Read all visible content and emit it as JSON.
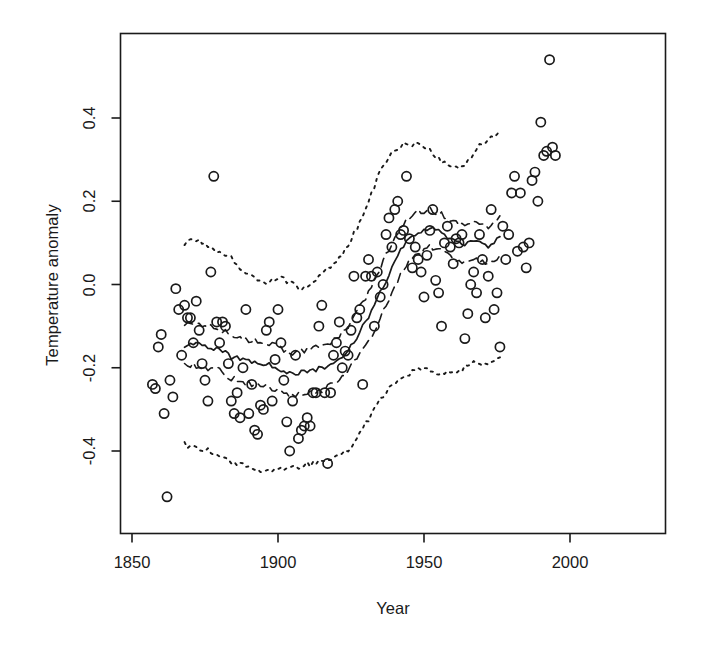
{
  "chart_data": {
    "type": "scatter",
    "title": "",
    "xlabel": "Year",
    "ylabel": "Temperature anomaly",
    "xlim": [
      1845,
      1998
    ],
    "ylim": [
      -0.56,
      0.575
    ],
    "xticks": [
      1850,
      1900,
      1950,
      2000
    ],
    "xtick_labels": [
      "1850",
      "1900",
      "1950",
      "2000"
    ],
    "yticks": [
      -0.4,
      -0.2,
      0.0,
      0.2,
      0.4
    ],
    "ytick_labels": [
      "-0.4",
      "-0.2",
      "0.0",
      "0.2",
      "0.4"
    ],
    "grid": false,
    "legend": null,
    "frame": true,
    "marker": "open-circle",
    "points": [
      [
        1857,
        -0.24
      ],
      [
        1858,
        -0.25
      ],
      [
        1859,
        -0.15
      ],
      [
        1860,
        -0.12
      ],
      [
        1861,
        -0.31
      ],
      [
        1862,
        -0.51
      ],
      [
        1863,
        -0.23
      ],
      [
        1864,
        -0.27
      ],
      [
        1865,
        -0.01
      ],
      [
        1866,
        -0.06
      ],
      [
        1867,
        -0.17
      ],
      [
        1868,
        -0.05
      ],
      [
        1869,
        -0.08
      ],
      [
        1870,
        -0.08
      ],
      [
        1871,
        -0.14
      ],
      [
        1872,
        -0.04
      ],
      [
        1873,
        -0.11
      ],
      [
        1874,
        -0.19
      ],
      [
        1875,
        -0.23
      ],
      [
        1876,
        -0.28
      ],
      [
        1877,
        0.03
      ],
      [
        1878,
        0.26
      ],
      [
        1879,
        -0.09
      ],
      [
        1880,
        -0.14
      ],
      [
        1881,
        -0.09
      ],
      [
        1882,
        -0.1
      ],
      [
        1883,
        -0.19
      ],
      [
        1884,
        -0.28
      ],
      [
        1885,
        -0.31
      ],
      [
        1886,
        -0.26
      ],
      [
        1887,
        -0.32
      ],
      [
        1888,
        -0.2
      ],
      [
        1889,
        -0.06
      ],
      [
        1890,
        -0.31
      ],
      [
        1891,
        -0.24
      ],
      [
        1892,
        -0.35
      ],
      [
        1893,
        -0.36
      ],
      [
        1894,
        -0.29
      ],
      [
        1895,
        -0.3
      ],
      [
        1896,
        -0.11
      ],
      [
        1897,
        -0.09
      ],
      [
        1898,
        -0.28
      ],
      [
        1899,
        -0.18
      ],
      [
        1900,
        -0.06
      ],
      [
        1901,
        -0.14
      ],
      [
        1902,
        -0.23
      ],
      [
        1903,
        -0.33
      ],
      [
        1904,
        -0.4
      ],
      [
        1905,
        -0.28
      ],
      [
        1906,
        -0.17
      ],
      [
        1907,
        -0.37
      ],
      [
        1908,
        -0.35
      ],
      [
        1909,
        -0.34
      ],
      [
        1910,
        -0.32
      ],
      [
        1911,
        -0.34
      ],
      [
        1912,
        -0.26
      ],
      [
        1913,
        -0.26
      ],
      [
        1914,
        -0.1
      ],
      [
        1915,
        -0.05
      ],
      [
        1916,
        -0.26
      ],
      [
        1917,
        -0.43
      ],
      [
        1918,
        -0.26
      ],
      [
        1919,
        -0.17
      ],
      [
        1920,
        -0.14
      ],
      [
        1921,
        -0.09
      ],
      [
        1922,
        -0.2
      ],
      [
        1923,
        -0.16
      ],
      [
        1924,
        -0.17
      ],
      [
        1925,
        -0.11
      ],
      [
        1926,
        0.02
      ],
      [
        1927,
        -0.08
      ],
      [
        1928,
        -0.06
      ],
      [
        1929,
        -0.24
      ],
      [
        1930,
        0.02
      ],
      [
        1931,
        0.06
      ],
      [
        1932,
        0.02
      ],
      [
        1933,
        -0.1
      ],
      [
        1934,
        0.03
      ],
      [
        1935,
        -0.03
      ],
      [
        1936,
        0.0
      ],
      [
        1937,
        0.12
      ],
      [
        1938,
        0.16
      ],
      [
        1939,
        0.09
      ],
      [
        1940,
        0.18
      ],
      [
        1941,
        0.2
      ],
      [
        1942,
        0.12
      ],
      [
        1943,
        0.13
      ],
      [
        1944,
        0.26
      ],
      [
        1945,
        0.11
      ],
      [
        1946,
        0.04
      ],
      [
        1947,
        0.09
      ],
      [
        1948,
        0.06
      ],
      [
        1949,
        0.03
      ],
      [
        1950,
        -0.03
      ],
      [
        1951,
        0.07
      ],
      [
        1952,
        0.13
      ],
      [
        1953,
        0.18
      ],
      [
        1954,
        0.01
      ],
      [
        1955,
        -0.02
      ],
      [
        1956,
        -0.1
      ],
      [
        1957,
        0.1
      ],
      [
        1958,
        0.14
      ],
      [
        1959,
        0.09
      ],
      [
        1960,
        0.05
      ],
      [
        1961,
        0.11
      ],
      [
        1962,
        0.1
      ],
      [
        1963,
        0.12
      ],
      [
        1964,
        -0.13
      ],
      [
        1965,
        -0.07
      ],
      [
        1966,
        0.0
      ],
      [
        1967,
        0.03
      ],
      [
        1968,
        -0.02
      ],
      [
        1969,
        0.12
      ],
      [
        1970,
        0.06
      ],
      [
        1971,
        -0.08
      ],
      [
        1972,
        0.02
      ],
      [
        1973,
        0.18
      ],
      [
        1974,
        -0.06
      ],
      [
        1975,
        -0.02
      ],
      [
        1976,
        -0.15
      ],
      [
        1977,
        0.14
      ],
      [
        1978,
        0.06
      ],
      [
        1979,
        0.12
      ],
      [
        1980,
        0.22
      ],
      [
        1981,
        0.26
      ],
      [
        1982,
        0.08
      ],
      [
        1983,
        0.22
      ],
      [
        1984,
        0.09
      ],
      [
        1985,
        0.04
      ],
      [
        1986,
        0.1
      ],
      [
        1987,
        0.25
      ],
      [
        1988,
        0.27
      ],
      [
        1989,
        0.2
      ],
      [
        1990,
        0.39
      ],
      [
        1991,
        0.31
      ],
      [
        1992,
        0.32
      ],
      [
        1993,
        0.54
      ],
      [
        1994,
        0.33
      ],
      [
        1995,
        0.31
      ]
    ],
    "series": [
      {
        "name": "central estimate",
        "style": "solid",
        "x": [
          1868,
          1872,
          1876,
          1880,
          1884,
          1888,
          1892,
          1896,
          1900,
          1904,
          1908,
          1912,
          1916,
          1920,
          1924,
          1928,
          1932,
          1936,
          1940,
          1944,
          1948,
          1952,
          1956,
          1960,
          1964,
          1968,
          1972,
          1976
        ],
        "values": [
          -0.145,
          -0.145,
          -0.15,
          -0.155,
          -0.175,
          -0.18,
          -0.185,
          -0.19,
          -0.2,
          -0.215,
          -0.21,
          -0.205,
          -0.2,
          -0.185,
          -0.155,
          -0.115,
          -0.065,
          -0.005,
          0.055,
          0.105,
          0.125,
          0.135,
          0.125,
          0.105,
          0.095,
          0.105,
          0.09,
          0.115
        ]
      },
      {
        "name": "inner band upper",
        "style": "dashed",
        "x": [
          1868,
          1872,
          1876,
          1880,
          1884,
          1888,
          1892,
          1896,
          1900,
          1904,
          1908,
          1912,
          1916,
          1920,
          1924,
          1928,
          1932,
          1936,
          1940,
          1944,
          1948,
          1952,
          1956,
          1960,
          1964,
          1968,
          1972,
          1976
        ],
        "values": [
          -0.1,
          -0.095,
          -0.1,
          -0.105,
          -0.125,
          -0.13,
          -0.135,
          -0.14,
          -0.15,
          -0.165,
          -0.16,
          -0.155,
          -0.145,
          -0.13,
          -0.1,
          -0.055,
          -0.005,
          0.055,
          0.115,
          0.155,
          0.175,
          0.18,
          0.17,
          0.15,
          0.14,
          0.15,
          0.14,
          0.165
        ]
      },
      {
        "name": "inner band lower",
        "style": "dashed",
        "x": [
          1868,
          1872,
          1876,
          1880,
          1884,
          1888,
          1892,
          1896,
          1900,
          1904,
          1908,
          1912,
          1916,
          1920,
          1924,
          1928,
          1932,
          1936,
          1940,
          1944,
          1948,
          1952,
          1956,
          1960,
          1964,
          1968,
          1972,
          1976
        ],
        "values": [
          -0.19,
          -0.195,
          -0.2,
          -0.205,
          -0.225,
          -0.235,
          -0.24,
          -0.245,
          -0.255,
          -0.27,
          -0.265,
          -0.26,
          -0.25,
          -0.235,
          -0.205,
          -0.17,
          -0.125,
          -0.065,
          -0.005,
          0.05,
          0.075,
          0.09,
          0.08,
          0.06,
          0.05,
          0.06,
          0.045,
          0.07
        ]
      },
      {
        "name": "outer band upper",
        "style": "dotted",
        "x": [
          1868,
          1872,
          1876,
          1880,
          1884,
          1888,
          1892,
          1896,
          1900,
          1904,
          1908,
          1912,
          1916,
          1920,
          1924,
          1928,
          1932,
          1936,
          1940,
          1944,
          1948,
          1952,
          1956,
          1960,
          1964,
          1968,
          1972,
          1976
        ],
        "values": [
          0.1,
          0.105,
          0.09,
          0.075,
          0.065,
          0.035,
          0.015,
          0.005,
          0.02,
          0.005,
          -0.01,
          0.005,
          0.03,
          0.055,
          0.09,
          0.15,
          0.22,
          0.285,
          0.325,
          0.34,
          0.335,
          0.32,
          0.295,
          0.275,
          0.29,
          0.325,
          0.35,
          0.37
        ]
      },
      {
        "name": "outer band lower",
        "style": "dotted",
        "x": [
          1868,
          1872,
          1876,
          1880,
          1884,
          1888,
          1892,
          1896,
          1900,
          1904,
          1908,
          1912,
          1916,
          1920,
          1924,
          1928,
          1932,
          1936,
          1940,
          1944,
          1948,
          1952,
          1956,
          1960,
          1964,
          1968,
          1972,
          1976
        ],
        "values": [
          -0.385,
          -0.39,
          -0.4,
          -0.41,
          -0.425,
          -0.435,
          -0.445,
          -0.45,
          -0.445,
          -0.44,
          -0.435,
          -0.43,
          -0.425,
          -0.415,
          -0.4,
          -0.36,
          -0.31,
          -0.265,
          -0.235,
          -0.215,
          -0.205,
          -0.205,
          -0.215,
          -0.215,
          -0.2,
          -0.185,
          -0.195,
          -0.175
        ]
      }
    ]
  }
}
